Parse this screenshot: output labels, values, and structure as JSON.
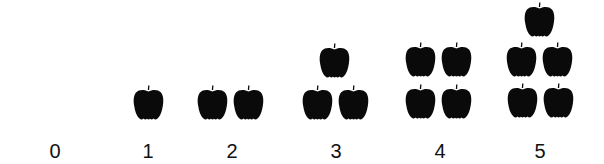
{
  "figure": {
    "title": "",
    "apple_color": "#0a0a0a",
    "groups": [
      {
        "label": "0",
        "count": 0,
        "cx": 55,
        "apples": []
      },
      {
        "label": "1",
        "count": 1,
        "cx": 148,
        "apples": [
          [
            133,
            85
          ]
        ]
      },
      {
        "label": "2",
        "count": 2,
        "cx": 232,
        "apples": [
          [
            197,
            85
          ],
          [
            233,
            85
          ]
        ]
      },
      {
        "label": "3",
        "count": 3,
        "cx": 336,
        "apples": [
          [
            302,
            85
          ],
          [
            338,
            85
          ],
          [
            319,
            43
          ]
        ]
      },
      {
        "label": "4",
        "count": 4,
        "cx": 440,
        "apples": [
          [
            405,
            84
          ],
          [
            441,
            84
          ],
          [
            405,
            42
          ],
          [
            441,
            42
          ]
        ]
      },
      {
        "label": "5",
        "count": 5,
        "cx": 540,
        "apples": [
          [
            507,
            83
          ],
          [
            543,
            83
          ],
          [
            506,
            42
          ],
          [
            542,
            42
          ],
          [
            524,
            2
          ]
        ]
      }
    ]
  }
}
